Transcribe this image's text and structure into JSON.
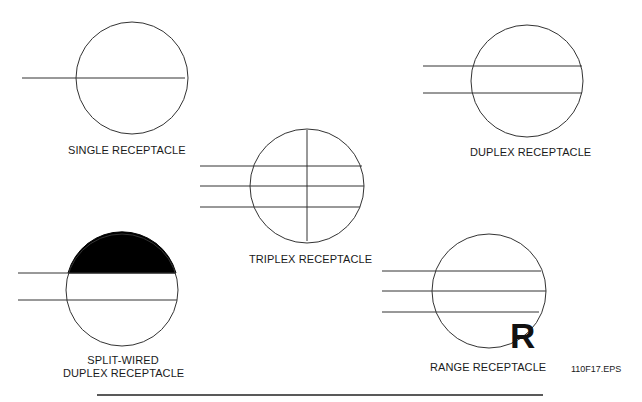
{
  "figure": {
    "id_label": "110F17.EPS",
    "colors": {
      "stroke": "#333333",
      "fill": "#000000",
      "background": "#ffffff"
    }
  },
  "symbols": [
    {
      "key": "single",
      "label": "SINGLE RECEPTACLE",
      "lines": 1,
      "vertical_divider": false,
      "half_filled": false
    },
    {
      "key": "duplex",
      "label": "DUPLEX RECEPTACLE",
      "lines": 2,
      "vertical_divider": false,
      "half_filled": false
    },
    {
      "key": "triplex",
      "label": "TRIPLEX RECEPTACLE",
      "lines": 3,
      "vertical_divider": true,
      "half_filled": false
    },
    {
      "key": "split_wired",
      "label_line1": "SPLIT-WIRED",
      "label_line2": "DUPLEX RECEPTACLE",
      "lines": 2,
      "vertical_divider": false,
      "half_filled": true
    },
    {
      "key": "range",
      "label": "RANGE RECEPTACLE",
      "lines": 3,
      "vertical_divider": false,
      "half_filled": false,
      "marker": "R"
    }
  ]
}
